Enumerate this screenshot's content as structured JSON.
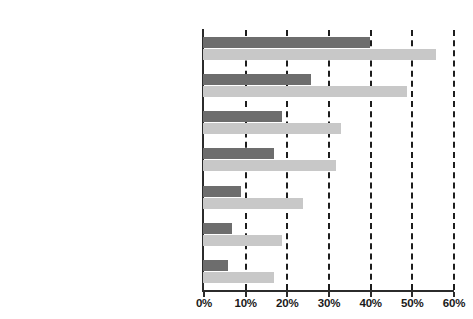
{
  "chart_data": {
    "type": "bar",
    "orientation": "horizontal",
    "title": "",
    "subtitle": "",
    "xlabel": "",
    "ylabel": "",
    "xlim": [
      0,
      60
    ],
    "grid": true,
    "grid_axis": "x",
    "legend_position": "none",
    "tick_labels": [
      "0%",
      "10%",
      "20%",
      "30%",
      "40%",
      "50%",
      "60%"
    ],
    "tick_values": [
      0,
      10,
      20,
      30,
      40,
      50,
      60
    ],
    "categories": [
      "Complained in person about\npoor service/faulty goods",
      "Complained on the phone about\npoor service/faulty goods",
      "Told relatives/friends to stop buying\nfrom a particular company",
      "Wrote letters of\ncomplaint/protest to companies",
      "Stopped buying from companies felt\nto be supplying unhealthy products",
      "Stopped buying from companies felt\nto be damaging the environment",
      "Stopped buying from\nunethical companies"
    ],
    "series": [
      {
        "name": "dark",
        "color": "#6d6d6d",
        "values": [
          40,
          26,
          19,
          17,
          9,
          7,
          6
        ]
      },
      {
        "name": "light",
        "color": "#c8c8c8",
        "values": [
          56,
          49,
          33,
          32,
          24,
          19,
          17
        ]
      }
    ],
    "colors": {
      "dark_series": "#6d6d6d",
      "light_series": "#c8c8c8",
      "axis": "#2b2b2b",
      "gridline": "#1d1d1d",
      "text": "#1a1a1a",
      "background": "#ffffff"
    }
  }
}
